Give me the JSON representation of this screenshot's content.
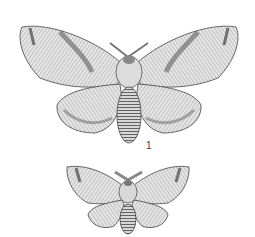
{
  "figure": {
    "specimens": [
      {
        "id": "large-moth",
        "label": "1"
      },
      {
        "id": "small-moth",
        "label": ""
      }
    ],
    "colors": {
      "background": "#ffffff",
      "ink": "#3a3a3a",
      "wing_light": "#e8e8e8",
      "wing_mid": "#b5b5b5",
      "wing_dark": "#6a6a6a"
    }
  }
}
